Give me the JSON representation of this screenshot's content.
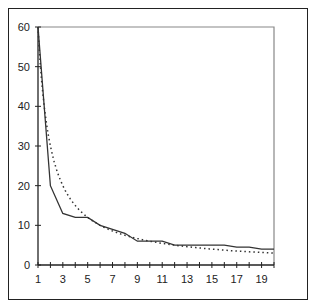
{
  "chart_data": {
    "type": "line",
    "title": "",
    "xlabel": "",
    "ylabel": "",
    "x": [
      1,
      2,
      3,
      4,
      5,
      6,
      7,
      8,
      9,
      10,
      11,
      12,
      13,
      14,
      15,
      16,
      17,
      18,
      19,
      20
    ],
    "series": [
      {
        "name": "observed",
        "style": "solid",
        "color": "#333333",
        "values": [
          60,
          20,
          13,
          12,
          12,
          10,
          9,
          8,
          6,
          6,
          6,
          5,
          5,
          5,
          5,
          5,
          4.5,
          4.5,
          4,
          4
        ]
      },
      {
        "name": "fitted",
        "style": "dotted",
        "color": "#333333",
        "values": [
          60,
          30,
          20,
          15,
          12,
          10,
          8.6,
          7.5,
          6.7,
          6,
          5.5,
          5,
          4.6,
          4.3,
          4,
          3.75,
          3.5,
          3.3,
          3.2,
          3
        ]
      }
    ],
    "xlim": [
      1,
      20
    ],
    "ylim": [
      0,
      60
    ],
    "x_tick_labels": [
      "1",
      "3",
      "5",
      "7",
      "9",
      "11",
      "13",
      "15",
      "17",
      "19"
    ],
    "y_tick_labels": [
      "0",
      "10",
      "20",
      "30",
      "40",
      "50",
      "60"
    ],
    "grid": false,
    "legend": null
  }
}
